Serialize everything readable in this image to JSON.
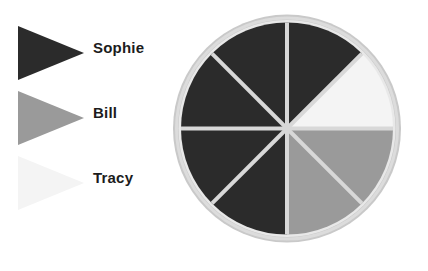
{
  "figure": {
    "title": "",
    "background_color": "#ffffff"
  },
  "legend": {
    "position": "left",
    "items": [
      {
        "label": "Sophie",
        "color": "#2b2b2b",
        "marker": "right-pointing-pennant"
      },
      {
        "label": "Bill",
        "color": "#9a9a9a",
        "marker": "right-pointing-pennant"
      },
      {
        "label": "Tracy",
        "color": "#f4f4f4",
        "marker": "right-pointing-pennant"
      }
    ]
  },
  "chart_data": {
    "type": "pie",
    "title": "",
    "xlabel": "",
    "ylabel": "",
    "legend_position": "left",
    "grid": false,
    "start_angle_deg": 0,
    "direction": "clockwise",
    "slice_count": 8,
    "slice_angle_deg": 45,
    "categories": [
      "Sophie",
      "Bill",
      "Tracy"
    ],
    "values": [
      5,
      2,
      1
    ],
    "percentages": [
      62.5,
      25.0,
      12.5
    ],
    "slices": [
      {
        "index": 0,
        "start_deg": 0,
        "end_deg": 45,
        "value": 1,
        "percent": 12.5,
        "category": "Sophie",
        "color": "#2b2b2b"
      },
      {
        "index": 1,
        "start_deg": 45,
        "end_deg": 90,
        "value": 1,
        "percent": 12.5,
        "category": "Tracy",
        "color": "#f4f4f4"
      },
      {
        "index": 2,
        "start_deg": 90,
        "end_deg": 135,
        "value": 1,
        "percent": 12.5,
        "category": "Bill",
        "color": "#9a9a9a"
      },
      {
        "index": 3,
        "start_deg": 135,
        "end_deg": 180,
        "value": 1,
        "percent": 12.5,
        "category": "Bill",
        "color": "#9a9a9a"
      },
      {
        "index": 4,
        "start_deg": 180,
        "end_deg": 225,
        "value": 1,
        "percent": 12.5,
        "category": "Sophie",
        "color": "#2b2b2b"
      },
      {
        "index": 5,
        "start_deg": 225,
        "end_deg": 270,
        "value": 1,
        "percent": 12.5,
        "category": "Sophie",
        "color": "#2b2b2b"
      },
      {
        "index": 6,
        "start_deg": 270,
        "end_deg": 315,
        "value": 1,
        "percent": 12.5,
        "category": "Sophie",
        "color": "#2b2b2b"
      },
      {
        "index": 7,
        "start_deg": 315,
        "end_deg": 360,
        "value": 1,
        "percent": 12.5,
        "category": "Sophie",
        "color": "#2b2b2b"
      }
    ],
    "colors": {
      "dark": "#2b2b2b",
      "gray": "#9a9a9a",
      "white": "#f4f4f4",
      "rim": "#c9c9c9",
      "divider": "#d8d8d8"
    }
  }
}
